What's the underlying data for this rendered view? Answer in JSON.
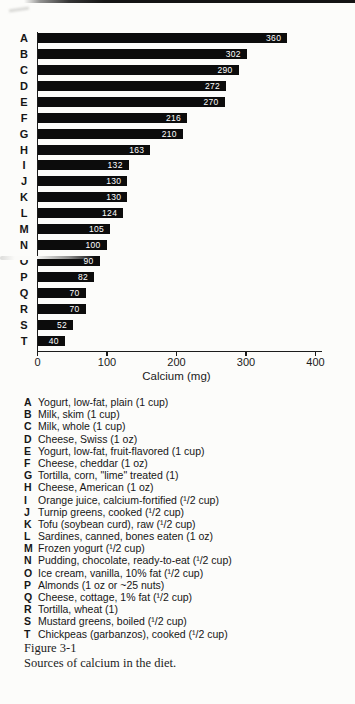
{
  "chart_data": {
    "type": "bar",
    "orientation": "horizontal",
    "title": "",
    "xlabel": "Calcium (mg)",
    "ylabel": "",
    "xlim": [
      0,
      400
    ],
    "xticks": [
      0,
      100,
      200,
      300,
      400
    ],
    "grid": false,
    "bar_color": "#0c0c0c",
    "value_label_color": "#ffffff",
    "categories": [
      "A",
      "B",
      "C",
      "D",
      "E",
      "F",
      "G",
      "H",
      "I",
      "J",
      "K",
      "L",
      "M",
      "N",
      "O",
      "P",
      "Q",
      "R",
      "S",
      "T"
    ],
    "values": [
      360,
      302,
      290,
      272,
      270,
      216,
      210,
      163,
      132,
      130,
      130,
      124,
      105,
      100,
      90,
      82,
      70,
      70,
      52,
      40
    ]
  },
  "legend": {
    "items": [
      {
        "key": "A",
        "label": "Yogurt, low-fat, plain (1 cup)"
      },
      {
        "key": "B",
        "label": "Milk, skim (1 cup)"
      },
      {
        "key": "C",
        "label": "Milk, whole (1 cup)"
      },
      {
        "key": "D",
        "label": "Cheese, Swiss (1 oz)"
      },
      {
        "key": "E",
        "label": "Yogurt, low-fat, fruit-flavored (1 cup)"
      },
      {
        "key": "F",
        "label": "Cheese, cheddar (1 oz)"
      },
      {
        "key": "G",
        "label": "Tortilla, corn, \"lime\" treated (1)"
      },
      {
        "key": "H",
        "label": "Cheese, American (1 oz)"
      },
      {
        "key": "I",
        "label": "Orange juice, calcium-fortified (¹/2 cup)"
      },
      {
        "key": "J",
        "label": "Turnip greens, cooked (¹/2 cup)"
      },
      {
        "key": "K",
        "label": "Tofu (soybean curd), raw (¹/2 cup)"
      },
      {
        "key": "L",
        "label": "Sardines, canned, bones eaten (1 oz)"
      },
      {
        "key": "M",
        "label": "Frozen yogurt (¹/2 cup)"
      },
      {
        "key": "N",
        "label": "Pudding, chocolate, ready-to-eat (¹/2 cup)"
      },
      {
        "key": "O",
        "label": "Ice cream, vanilla, 10% fat (¹/2 cup)"
      },
      {
        "key": "P",
        "label": "Almonds (1 oz or ~25 nuts)"
      },
      {
        "key": "Q",
        "label": "Cheese, cottage, 1% fat (¹/2 cup)"
      },
      {
        "key": "R",
        "label": "Tortilla, wheat (1)"
      },
      {
        "key": "S",
        "label": "Mustard greens, boiled (¹/2 cup)"
      },
      {
        "key": "T",
        "label": "Chickpeas (garbanzos), cooked (¹/2 cup)"
      }
    ]
  },
  "caption": {
    "figure_label": "Figure 3-1",
    "figure_title": "Sources of calcium in the diet."
  }
}
